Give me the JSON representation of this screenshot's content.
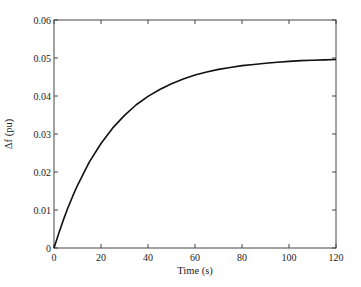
{
  "chart_data": {
    "type": "line",
    "title": "",
    "xlabel": "Time (s)",
    "ylabel": "Δf (pu)",
    "xlim": [
      0,
      120
    ],
    "ylim": [
      0,
      0.06
    ],
    "x_ticks": [
      0,
      20,
      40,
      60,
      80,
      100,
      120
    ],
    "x_tick_labels": [
      "0",
      "20",
      "40",
      "60",
      "80",
      "100",
      "120"
    ],
    "y_ticks": [
      0,
      0.01,
      0.02,
      0.03,
      0.04,
      0.05,
      0.06
    ],
    "y_tick_labels": [
      "0",
      "0.01",
      "0.02",
      "0.03",
      "0.04",
      "0.05",
      "0.06"
    ],
    "grid": false,
    "legend": null,
    "series": [
      {
        "name": "Δf",
        "color": "#111111",
        "x": [
          0,
          2,
          4,
          6,
          8,
          10,
          15,
          20,
          25,
          30,
          35,
          40,
          45,
          50,
          55,
          60,
          65,
          70,
          75,
          80,
          85,
          90,
          95,
          100,
          105,
          110,
          115,
          120
        ],
        "values": [
          0,
          0.0038,
          0.0074,
          0.0107,
          0.0137,
          0.0165,
          0.0226,
          0.0275,
          0.0316,
          0.0349,
          0.0377,
          0.0399,
          0.0417,
          0.0432,
          0.0445,
          0.0455,
          0.0463,
          0.047,
          0.0475,
          0.048,
          0.0483,
          0.0486,
          0.0489,
          0.0491,
          0.0493,
          0.0494,
          0.0495,
          0.0496
        ]
      }
    ]
  }
}
